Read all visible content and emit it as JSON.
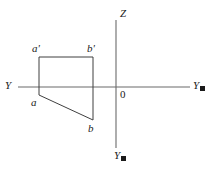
{
  "figure": {
    "kind": "descriptive-geometry-projection",
    "background_color": "#ffffff",
    "line_color": "#3f3f3f",
    "axis_color": "#6b6b6b",
    "text_color": "#1a1a1a"
  },
  "axes": {
    "horizontal": {
      "name": "horizontal-axis",
      "x_start": 18,
      "x_end": 190,
      "y": 87,
      "left_label": "Y",
      "right_label": "Y",
      "right_label_has_subscript_box": true
    },
    "vertical": {
      "name": "vertical-axis",
      "x": 116,
      "y_start": 20,
      "y_end": 148,
      "top_label": "Z",
      "bottom_label": "Y",
      "bottom_label_has_subscript_box": true
    },
    "origin": {
      "label": "0",
      "x": 116,
      "y": 87
    }
  },
  "labels": {
    "z_axis": "Z",
    "origin": "0",
    "y_left": "Y",
    "y_right": "Y",
    "y_bottom": "Y",
    "a_prime": "a'",
    "b_prime": "b'",
    "a": "a",
    "b": "b"
  },
  "points": {
    "a_prime": {
      "label": "a'",
      "x": 39,
      "y": 57
    },
    "b_prime": {
      "label": "b'",
      "x": 93,
      "y": 57
    },
    "a": {
      "label": "a",
      "x": 39,
      "y": 95
    },
    "b": {
      "label": "b",
      "x": 93,
      "y": 120
    }
  },
  "shape": {
    "name": "projection-quadrilateral",
    "description": "Closed figure a'-b'-b-a formed by two verticals, a top horizontal and a slanted lower edge",
    "vertices": [
      {
        "id": "a_prime",
        "x": 39,
        "y": 57
      },
      {
        "id": "b_prime",
        "x": 93,
        "y": 57
      },
      {
        "id": "b",
        "x": 93,
        "y": 120
      },
      {
        "id": "a",
        "x": 39,
        "y": 95
      }
    ],
    "edges": [
      {
        "from": "a_prime",
        "to": "b_prime",
        "type": "horizontal"
      },
      {
        "from": "b_prime",
        "to": "b",
        "type": "vertical"
      },
      {
        "from": "b",
        "to": "a",
        "type": "slanted"
      },
      {
        "from": "a",
        "to": "a_prime",
        "type": "vertical"
      }
    ]
  }
}
